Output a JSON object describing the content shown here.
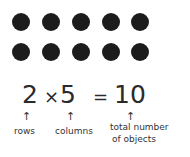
{
  "array": {
    "rows": 2,
    "columns": 5,
    "dot_color": "#1c1c1c"
  },
  "equation": {
    "rows_value": "2",
    "times": "×",
    "columns_value": "5",
    "equals": "=",
    "total_value": "10"
  },
  "arrows": {
    "glyph": "↑"
  },
  "labels": {
    "rows": "rows",
    "columns": "columns",
    "total_line1": "total number",
    "total_line2": "of objects"
  }
}
